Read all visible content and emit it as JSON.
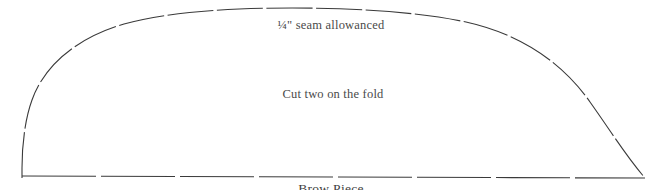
{
  "document": {
    "type": "sewing-pattern-piece",
    "background_color": "#ffffff",
    "line_color": "#3a3a3a",
    "text_color": "#4a4a4a"
  },
  "annotations": {
    "seam_allowance": "¼\" seam allowanced",
    "cut_instruction": "Cut two on the fold",
    "piece_name": "Brow Piece"
  },
  "shape": {
    "name": "arched-dome-outline",
    "stroke_style": "dashed",
    "stroke_width": 1,
    "arc_path": "M 22,176 L 22,166 C 24,96 90,24 200,13 C 260,7 330,7 400,10 C 500,16 580,60 630,130 L 645,178",
    "baseline_path": "M 22,176 L 645,178",
    "arc_dash_pattern": "46 4",
    "baseline_dash_pattern": "72 6"
  }
}
